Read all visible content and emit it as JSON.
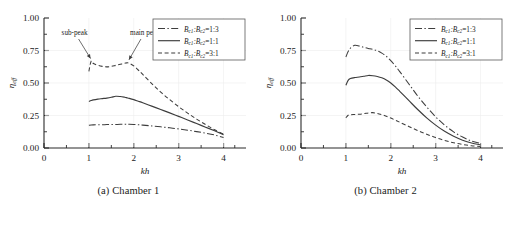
{
  "figure": {
    "panels": [
      {
        "id": "a",
        "caption": "(a) Chamber 1",
        "axes": {
          "xlabel": "kh",
          "ylabel": "η",
          "ylabel_sub": "eff",
          "xticks": [
            "0",
            "1",
            "2",
            "3",
            "4"
          ],
          "yticks": [
            "0.00",
            "0.25",
            "0.50",
            "0.75",
            "1.00"
          ],
          "xlim": [
            0,
            4.5
          ],
          "ylim": [
            0,
            1.0
          ]
        },
        "legend": [
          {
            "label_main": "B",
            "sub1": "c1",
            "sep": ":B",
            "sub2": "c2",
            "value": "=1:3",
            "style": "dash-dot"
          },
          {
            "label_main": "B",
            "sub1": "c1",
            "sep": ":B",
            "sub2": "c2",
            "value": "=1:1",
            "style": "solid"
          },
          {
            "label_main": "B",
            "sub1": "c1",
            "sep": ":B",
            "sub2": "c2",
            "value": "=3:1",
            "style": "dashed"
          }
        ],
        "annotations": [
          {
            "text": "sub-peak",
            "target_x": 1.06,
            "target_y": 0.665
          },
          {
            "text": "main peak",
            "target_x": 1.87,
            "target_y": 0.655
          }
        ]
      },
      {
        "id": "b",
        "caption": "(b) Chamber 2",
        "axes": {
          "xlabel": "kh",
          "ylabel": "η",
          "ylabel_sub": "eff",
          "xticks": [
            "0",
            "1",
            "2",
            "3",
            "4"
          ],
          "yticks": [
            "0.00",
            "0.25",
            "0.50",
            "0.75",
            "1.00"
          ],
          "xlim": [
            0,
            4.5
          ],
          "ylim": [
            0,
            1.0
          ]
        },
        "legend": [
          {
            "label_main": "B",
            "sub1": "c1",
            "sep": ":B",
            "sub2": "c2",
            "value": "=1:3",
            "style": "dash-dot"
          },
          {
            "label_main": "B",
            "sub1": "c1",
            "sep": ":B",
            "sub2": "c2",
            "value": "=1:1",
            "style": "solid"
          },
          {
            "label_main": "B",
            "sub1": "c1",
            "sep": ":B",
            "sub2": "c2",
            "value": "=3:1",
            "style": "dashed"
          }
        ],
        "annotations": []
      }
    ]
  },
  "chart_data": [
    {
      "type": "line",
      "title": "(a) Chamber 1",
      "xlabel": "kh",
      "ylabel": "η_eff",
      "xlim": [
        0,
        4.5
      ],
      "ylim": [
        0,
        1.0
      ],
      "xticks": [
        0,
        1,
        2,
        3,
        4
      ],
      "yticks": [
        0.0,
        0.25,
        0.5,
        0.75,
        1.0
      ],
      "grid": false,
      "legend_position": "upper-right",
      "x": [
        1.0,
        1.05,
        1.1,
        1.2,
        1.3,
        1.4,
        1.5,
        1.6,
        1.7,
        1.8,
        1.85,
        1.9,
        2.0,
        2.1,
        2.2,
        2.4,
        2.6,
        2.8,
        3.0,
        3.2,
        3.4,
        3.6,
        3.8,
        4.0
      ],
      "series": [
        {
          "name": "B_c1:B_c2=1:3",
          "style": "dash-dot",
          "values": [
            0.175,
            0.177,
            0.178,
            0.179,
            0.179,
            0.18,
            0.18,
            0.181,
            0.182,
            0.182,
            0.182,
            0.182,
            0.181,
            0.179,
            0.176,
            0.17,
            0.163,
            0.155,
            0.147,
            0.137,
            0.126,
            0.114,
            0.1,
            0.081
          ]
        },
        {
          "name": "B_c1:B_c2=1:1",
          "style": "solid",
          "values": [
            0.358,
            0.365,
            0.37,
            0.376,
            0.38,
            0.384,
            0.39,
            0.398,
            0.396,
            0.39,
            0.386,
            0.382,
            0.372,
            0.36,
            0.348,
            0.322,
            0.296,
            0.27,
            0.243,
            0.216,
            0.188,
            0.16,
            0.132,
            0.103
          ]
        },
        {
          "name": "B_c1:B_c2=3:1",
          "style": "dashed",
          "values": [
            0.59,
            0.668,
            0.65,
            0.636,
            0.628,
            0.624,
            0.628,
            0.636,
            0.644,
            0.652,
            0.655,
            0.652,
            0.632,
            0.6,
            0.566,
            0.496,
            0.43,
            0.372,
            0.318,
            0.268,
            0.222,
            0.18,
            0.141,
            0.106
          ]
        }
      ],
      "annotations": [
        {
          "text": "sub-peak",
          "x": 1.06,
          "y": 0.665
        },
        {
          "text": "main peak",
          "x": 1.87,
          "y": 0.655
        }
      ]
    },
    {
      "type": "line",
      "title": "(b) Chamber 2",
      "xlabel": "kh",
      "ylabel": "η_eff",
      "xlim": [
        0,
        4.5
      ],
      "ylim": [
        0,
        1.0
      ],
      "xticks": [
        0,
        1,
        2,
        3,
        4
      ],
      "yticks": [
        0.0,
        0.25,
        0.5,
        0.75,
        1.0
      ],
      "grid": false,
      "legend_position": "upper-right",
      "x": [
        1.0,
        1.05,
        1.1,
        1.2,
        1.3,
        1.4,
        1.5,
        1.6,
        1.7,
        1.8,
        1.9,
        2.0,
        2.1,
        2.2,
        2.4,
        2.6,
        2.8,
        3.0,
        3.2,
        3.4,
        3.6,
        3.8,
        4.0
      ],
      "series": [
        {
          "name": "B_c1:B_c2=1:3",
          "style": "dash-dot",
          "values": [
            0.7,
            0.742,
            0.768,
            0.79,
            0.784,
            0.774,
            0.766,
            0.758,
            0.748,
            0.73,
            0.706,
            0.672,
            0.632,
            0.588,
            0.494,
            0.4,
            0.316,
            0.24,
            0.176,
            0.124,
            0.084,
            0.054,
            0.036
          ]
        },
        {
          "name": "B_c1:B_c2=1:1",
          "style": "solid",
          "values": [
            0.482,
            0.52,
            0.534,
            0.542,
            0.546,
            0.552,
            0.558,
            0.556,
            0.55,
            0.54,
            0.524,
            0.5,
            0.47,
            0.436,
            0.366,
            0.296,
            0.232,
            0.176,
            0.128,
            0.09,
            0.06,
            0.038,
            0.024
          ]
        },
        {
          "name": "B_c1:B_c2=3:1",
          "style": "dashed",
          "values": [
            0.232,
            0.252,
            0.256,
            0.258,
            0.26,
            0.264,
            0.27,
            0.272,
            0.266,
            0.256,
            0.244,
            0.23,
            0.214,
            0.198,
            0.166,
            0.134,
            0.106,
            0.08,
            0.058,
            0.04,
            0.027,
            0.017,
            0.011
          ]
        }
      ],
      "annotations": []
    }
  ]
}
